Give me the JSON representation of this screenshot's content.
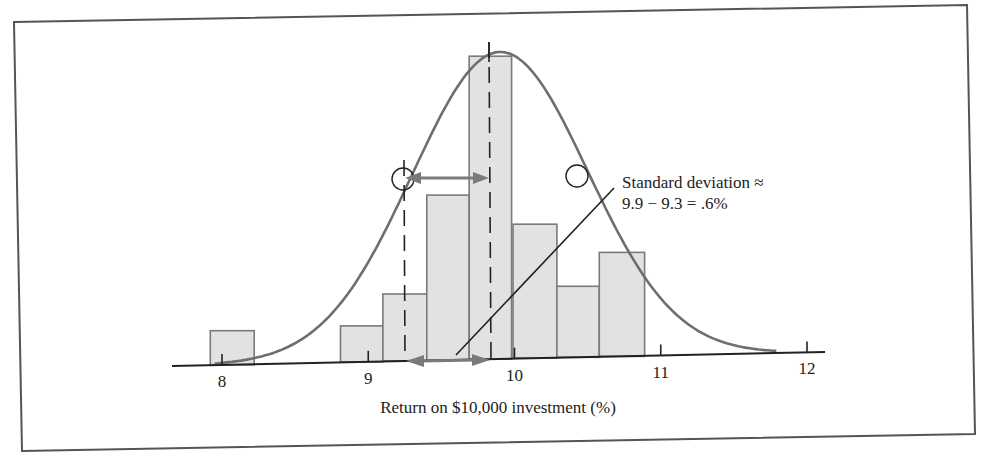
{
  "chart_data": {
    "type": "bar",
    "subtype": "histogram-with-normal-curve",
    "title": "",
    "xlabel": "Return on $10,000 investment (%)",
    "ylabel": "",
    "xlim": [
      7.7,
      12.1
    ],
    "x_ticks": [
      8,
      9,
      10,
      11,
      12
    ],
    "x_tick_labels": [
      "8",
      "9",
      "10",
      "11",
      "12"
    ],
    "grid": false,
    "legend": null,
    "bins": [
      {
        "x0": 7.92,
        "x1": 8.22,
        "height": 34
      },
      {
        "x0": 8.81,
        "x1": 9.1,
        "height": 36
      },
      {
        "x0": 9.1,
        "x1": 9.4,
        "height": 67
      },
      {
        "x0": 9.4,
        "x1": 9.69,
        "height": 165
      },
      {
        "x0": 9.69,
        "x1": 9.98,
        "height": 303
      },
      {
        "x0": 9.99,
        "x1": 10.29,
        "height": 134
      },
      {
        "x0": 10.29,
        "x1": 10.58,
        "height": 71
      },
      {
        "x0": 10.58,
        "x1": 10.89,
        "height": 104
      }
    ],
    "normal_curve": {
      "mean": 9.9,
      "sd": 0.6,
      "peak_height": 307
    },
    "mean_line_x": 9.9,
    "sd_line_x": 9.3,
    "annotation": {
      "line1": "Standard deviation ≈",
      "line2": "9.9 − 9.3 = .6%"
    }
  },
  "colors": {
    "bar_fill": "#e2e2e2",
    "bar_stroke": "#7a7a7a",
    "curve": "#6e6e6e",
    "arrow": "#7a7a7a",
    "axis": "#222222",
    "frame": "#555555"
  }
}
